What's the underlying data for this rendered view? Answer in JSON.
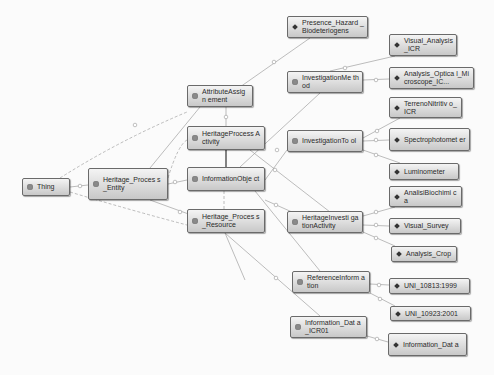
{
  "diagram": {
    "type": "ontology-graph",
    "classes": [
      {
        "id": "thing",
        "label": "Thing"
      },
      {
        "id": "hpe",
        "label": "Heritage_Process_Entity"
      },
      {
        "id": "aa",
        "label": "AttributeAssignment"
      },
      {
        "id": "hpa",
        "label": "HeritageProcessActivity"
      },
      {
        "id": "io",
        "label": "InformationObject"
      },
      {
        "id": "hpr",
        "label": "Heritage_Process_Resource"
      },
      {
        "id": "im",
        "label": "InvestigationMethod"
      },
      {
        "id": "it",
        "label": "InvestigationTool"
      },
      {
        "id": "hia",
        "label": "HeritageInvestigationActivity"
      },
      {
        "id": "ri",
        "label": "ReferenceInformation"
      },
      {
        "id": "idi",
        "label": "Information_Data_ICR01"
      }
    ],
    "individuals": [
      {
        "id": "phb",
        "label": "Presence_Hazard_Biodeteriogens"
      },
      {
        "id": "va",
        "label": "Visual_Analysis_ICR"
      },
      {
        "id": "aom",
        "label": "Analysis_Optical_Microscope_IC..."
      },
      {
        "id": "tn",
        "label": "TerrenoNitritivo_ICR"
      },
      {
        "id": "sp",
        "label": "Spectrophotometer"
      },
      {
        "id": "lu",
        "label": "Luminometer"
      },
      {
        "id": "ab",
        "label": "AnalisiBiochimica"
      },
      {
        "id": "vs",
        "label": "Visual_Survey"
      },
      {
        "id": "ac",
        "label": "Analysis_Crop"
      },
      {
        "id": "uni1",
        "label": "UNI_10813:1999"
      },
      {
        "id": "uni2",
        "label": "UNI_10923:2001"
      },
      {
        "id": "idata",
        "label": "Information_Data"
      }
    ],
    "display_labels": {
      "thing": "Thing",
      "hpe": "Heritage_Proces s_Entity",
      "aa": "AttributeAssign ement",
      "hpa": "HeritageProcess Activity",
      "io": "InformationObje ct",
      "hpr": "Heritage_Proces s_Resource",
      "im": "InvestigationMe thod",
      "it": "InvestigationTo ol",
      "hia": "HeritageInvesti gationActivity",
      "ri": "ReferenceInform ation",
      "idi": "Information_Dat a_ICR01",
      "phb": "Presence_Hazard _Biodeteriogens",
      "va": "Visual_Analysis _ICR",
      "aom": "Analysis_Optica l_Microscope_IC...",
      "tn": "TerrenoNitritiv o_ICR",
      "sp": "Spectrophotomet er",
      "lu": "Luminometer",
      "ab": "AnalisiBiochimi ca",
      "vs": "Visual_Survey",
      "ac": "Analysis_Crop",
      "uni1": "UNI_10813:1999",
      "uni2": "UNI_10923:2001",
      "idata": "Information_Dat a"
    },
    "colors": {
      "node_border": "#6a6a6a",
      "node_fill_top": "#f4f4f4",
      "node_fill_bottom": "#c8c8c8",
      "edge": "#9a9a9a",
      "class_dot": "#8a8a8a",
      "individual_diamond": "#333333"
    }
  }
}
